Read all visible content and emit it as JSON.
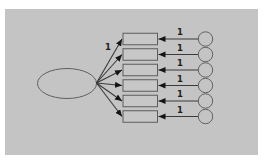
{
  "diagram": {
    "type": "confirmatory-factor-analysis-path-diagram",
    "panel_color": "#c4c4c4",
    "shape_stroke_color": "#606060",
    "line_color": "#3a3a3a",
    "arrowhead_color": "#141414",
    "text_color": "#1c1c1c",
    "latent_variable": {
      "shape": "ellipse",
      "label": ""
    },
    "factor_loading_label": "1",
    "rows": [
      {
        "indicator": {
          "shape": "rectangle",
          "label": ""
        },
        "error_term": {
          "shape": "circle",
          "label": ""
        },
        "error_path_label": "1"
      },
      {
        "indicator": {
          "shape": "rectangle",
          "label": ""
        },
        "error_term": {
          "shape": "circle",
          "label": ""
        },
        "error_path_label": "1"
      },
      {
        "indicator": {
          "shape": "rectangle",
          "label": ""
        },
        "error_term": {
          "shape": "circle",
          "label": ""
        },
        "error_path_label": "1"
      },
      {
        "indicator": {
          "shape": "rectangle",
          "label": ""
        },
        "error_term": {
          "shape": "circle",
          "label": ""
        },
        "error_path_label": "1"
      },
      {
        "indicator": {
          "shape": "rectangle",
          "label": ""
        },
        "error_term": {
          "shape": "circle",
          "label": ""
        },
        "error_path_label": "1"
      },
      {
        "indicator": {
          "shape": "rectangle",
          "label": ""
        },
        "error_term": {
          "shape": "circle",
          "label": ""
        },
        "error_path_label": "1"
      }
    ]
  }
}
